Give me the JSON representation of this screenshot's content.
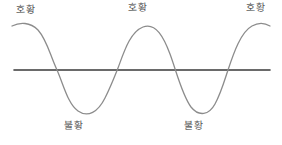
{
  "diagram": {
    "colors": {
      "background": "#ffffff",
      "curve_stroke": "#8c8c8c",
      "axis_stroke": "#3a3a3a",
      "label_text": "#555555"
    },
    "axis": {
      "name": "baseline-axis",
      "y": 70,
      "x_start": 14,
      "x_end": 270,
      "stroke_width": 1.6
    },
    "curve": {
      "name": "business-cycle-curve",
      "stroke_width": 1.3,
      "peak_y": 25,
      "trough_y": 112,
      "baseline_y": 70,
      "peaks_x": [
        26,
        143,
        262
      ],
      "troughs_x": [
        78,
        198
      ],
      "crossings_x": [
        57,
        113,
        172,
        228
      ],
      "path": "M 12,26 C 20,22 30,22 38,30 C 47,40 50,55 57,70 C 64,86 68,104 78,111 C 88,118 98,112 105,98 C 111,86 114,78 118,68 C 124,52 130,32 143,27 C 156,22 164,38 170,54 C 176,70 182,95 191,107 C 199,117 209,115 215,104 C 221,93 224,82 228,70 C 234,52 241,32 252,26 C 259,22 265,23 270,26"
    },
    "labels": {
      "boom": [
        {
          "id": "boom-label-1",
          "text": "호황",
          "meaning": "boom",
          "x": 16,
          "y": 5
        },
        {
          "id": "boom-label-2",
          "text": "호황",
          "meaning": "boom",
          "x": 128,
          "y": 3
        },
        {
          "id": "boom-label-3",
          "text": "호황",
          "meaning": "boom",
          "x": 246,
          "y": 3
        }
      ],
      "bust": [
        {
          "id": "bust-label-1",
          "text": "불황",
          "meaning": "recession",
          "x": 64,
          "y": 121
        },
        {
          "id": "bust-label-2",
          "text": "불황",
          "meaning": "recession",
          "x": 184,
          "y": 121
        }
      ]
    }
  },
  "chart_data": {
    "type": "line",
    "title": "",
    "xlabel": "",
    "ylabel": "",
    "grid": false,
    "legend": "none",
    "annotations": [
      "호황",
      "호황",
      "호황",
      "불황",
      "불황"
    ],
    "series": [
      {
        "name": "business-cycle",
        "x": [
          12,
          26,
          57,
          78,
          113,
          143,
          172,
          198,
          228,
          262,
          270
        ],
        "values": [
          1,
          1,
          0,
          -1,
          0,
          1,
          0,
          -1,
          0,
          1,
          1
        ]
      }
    ],
    "ylim": [
      -1.2,
      1.2
    ],
    "baseline": 0
  }
}
